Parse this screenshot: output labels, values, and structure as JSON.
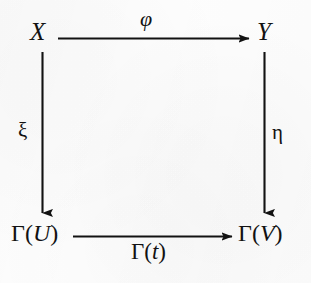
{
  "diagram": {
    "kind": "commutative-square",
    "background_color": "#fdfdfd",
    "ink_color": "#121212",
    "nodes": [
      {
        "id": "top-left",
        "label": "X",
        "position": "top-left"
      },
      {
        "id": "top-right",
        "label": "Y",
        "position": "top-right"
      },
      {
        "id": "bottom-left",
        "label": "Γ(U)",
        "position": "bottom-left"
      },
      {
        "id": "bottom-right",
        "label": "Γ(V)",
        "position": "bottom-right"
      }
    ],
    "edges": [
      {
        "id": "top-edge",
        "label": "φ",
        "from": "X",
        "to": "Y",
        "direction": "right",
        "label_position": "above"
      },
      {
        "id": "left-edge",
        "label": "ξ",
        "from": "X",
        "to": "Γ(U)",
        "direction": "down",
        "label_position": "left"
      },
      {
        "id": "right-edge",
        "label": "η",
        "from": "Y",
        "to": "Γ(V)",
        "direction": "down",
        "label_position": "right"
      },
      {
        "id": "bottom-edge",
        "label": "Γ(t)",
        "from": "Γ(U)",
        "to": "Γ(V)",
        "direction": "right",
        "label_position": "below"
      }
    ],
    "node_parts": {
      "gamma": "Γ",
      "open_paren": "(",
      "close_paren": ")",
      "u": "U",
      "v": "V",
      "t": "t"
    }
  }
}
